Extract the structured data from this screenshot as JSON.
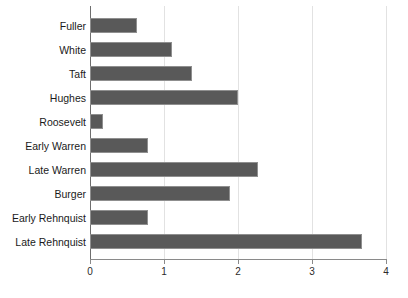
{
  "chart_data": {
    "type": "bar",
    "orientation": "horizontal",
    "title": "",
    "subtitle": "",
    "xlabel": "",
    "ylabel": "",
    "categories": [
      "Fuller",
      "White",
      "Taft",
      "Hughes",
      "Roosevelt",
      "Early Warren",
      "Late Warren",
      "Burger",
      "Early Rehnquist",
      "Late Rehnquist"
    ],
    "values": [
      0.64,
      1.11,
      1.38,
      2.0,
      0.18,
      0.78,
      2.27,
      1.89,
      0.78,
      3.68
    ],
    "xlim": [
      0,
      4
    ],
    "xticks": [
      0,
      1,
      2,
      3,
      4
    ],
    "xtick_labels": [
      "0",
      "1",
      "2",
      "3",
      "4"
    ],
    "grid": true,
    "grid_axis": "x",
    "legend": "none",
    "bar_color": "#595959",
    "bar_edge_color": "#8f8f8f",
    "grid_color": "#e2e2e2",
    "axis_color": "#8a8a8a"
  },
  "axis": {
    "ticks": [
      {
        "label": "0",
        "value": 0
      },
      {
        "label": "1",
        "value": 1
      },
      {
        "label": "2",
        "value": 2
      },
      {
        "label": "3",
        "value": 3
      },
      {
        "label": "4",
        "value": 4
      }
    ]
  },
  "caption": {
    "cropped_text": ""
  }
}
